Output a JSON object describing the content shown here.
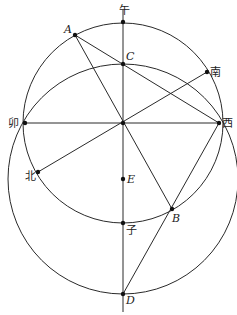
{
  "diagram": {
    "type": "geometry",
    "circles": [
      {
        "name": "circle-O",
        "center": "O",
        "cx": 123,
        "cy": 123,
        "r": 100
      },
      {
        "name": "circle-E",
        "center": "E",
        "cx": 123,
        "cy": 179,
        "r": 115
      }
    ],
    "points": [
      {
        "id": "wu",
        "label": "午",
        "x": 123,
        "y": 22,
        "lx": 119,
        "ly": 14
      },
      {
        "id": "A",
        "label": "A",
        "x": 75,
        "y": 35,
        "lx": 64,
        "ly": 33
      },
      {
        "id": "C",
        "label": "C",
        "x": 123,
        "y": 64,
        "lx": 126,
        "ly": 60
      },
      {
        "id": "nan",
        "label": "南",
        "x": 207,
        "y": 72,
        "lx": 210,
        "ly": 76
      },
      {
        "id": "mao",
        "label": "卯",
        "x": 25,
        "y": 123,
        "lx": 8,
        "ly": 127
      },
      {
        "id": "O",
        "label": "",
        "x": 123,
        "y": 123,
        "lx": 0,
        "ly": 0
      },
      {
        "id": "xi",
        "label": "西",
        "x": 219,
        "y": 123,
        "lx": 222,
        "ly": 127
      },
      {
        "id": "bei",
        "label": "北",
        "x": 38,
        "y": 172,
        "lx": 25,
        "ly": 180
      },
      {
        "id": "E",
        "label": "E",
        "x": 123,
        "y": 179,
        "lx": 127,
        "ly": 183
      },
      {
        "id": "B",
        "label": "B",
        "x": 172,
        "y": 209,
        "lx": 172,
        "ly": 222
      },
      {
        "id": "zi",
        "label": "子",
        "x": 123,
        "y": 223,
        "lx": 126,
        "ly": 234
      },
      {
        "id": "D",
        "label": "D",
        "x": 123,
        "y": 294,
        "lx": 126,
        "ly": 304
      }
    ],
    "segments": [
      {
        "name": "line-wu-D",
        "x1": 123,
        "y1": 10,
        "x2": 123,
        "y2": 312
      },
      {
        "name": "line-mao-xi",
        "x1": 25,
        "y1": 123,
        "x2": 219,
        "y2": 123
      },
      {
        "name": "line-A-B",
        "x1": 75,
        "y1": 35,
        "x2": 172,
        "y2": 209
      },
      {
        "name": "line-A-xi",
        "x1": 75,
        "y1": 35,
        "x2": 219,
        "y2": 123
      },
      {
        "name": "line-nan-bei",
        "x1": 207,
        "y1": 72,
        "x2": 38,
        "y2": 172
      },
      {
        "name": "line-xi-D",
        "x1": 219,
        "y1": 123,
        "x2": 123,
        "y2": 294
      }
    ]
  }
}
